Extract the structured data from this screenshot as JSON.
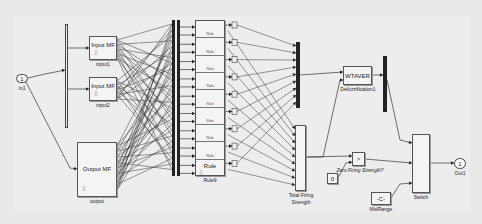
{
  "diagram": {
    "type": "simulink-block-diagram",
    "inports": [
      {
        "id": "in1",
        "number": "1",
        "label": "In1"
      }
    ],
    "outports": [
      {
        "id": "out1",
        "number": "1",
        "label": "Out1"
      }
    ],
    "blocks": {
      "input1": {
        "title": "Input MF",
        "label": "input1"
      },
      "input2": {
        "title": "Input MF",
        "label": "input2"
      },
      "output_mf": {
        "title": "Output MF",
        "label": "output"
      },
      "rules": {
        "stack_item_label": "Rule",
        "count": 9,
        "label": "Rule9"
      },
      "total_firing": {
        "label_line1": "Total Firing",
        "label_line2": "Strength"
      },
      "defuzz": {
        "title": "WTAVER",
        "label": "Defuzzification1"
      },
      "zero_firing": {
        "symbol": ">",
        "label": "Zero Firing Strength?"
      },
      "zero_const": {
        "value": "0"
      },
      "midrange": {
        "value": "-C-",
        "label": "MidRange"
      },
      "switch": {
        "label": "Switch"
      }
    },
    "mask_icon": "down-arrow-icon"
  }
}
